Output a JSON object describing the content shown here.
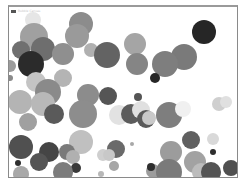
{
  "window": {
    "title": "Bubble Canvas",
    "title_icon": "app-icon"
  },
  "canvas": {
    "background": "#ffffff",
    "bubbles": [
      {
        "x": 32,
        "y": 18,
        "r": 8,
        "color": "#e6e6e6"
      },
      {
        "x": 80,
        "y": 22,
        "r": 12,
        "color": "#8c8c8c"
      },
      {
        "x": 76,
        "y": 34,
        "r": 12,
        "color": "#9a9a9a"
      },
      {
        "x": 33,
        "y": 35,
        "r": 14,
        "color": "#a0a0a0"
      },
      {
        "x": 20,
        "y": 48,
        "r": 9,
        "color": "#707070"
      },
      {
        "x": 42,
        "y": 47,
        "r": 12,
        "color": "#6e6e6e"
      },
      {
        "x": 62,
        "y": 52,
        "r": 11,
        "color": "#8f8f8f"
      },
      {
        "x": 90,
        "y": 48,
        "r": 7,
        "color": "#b0b0b0"
      },
      {
        "x": 106,
        "y": 53,
        "r": 13,
        "color": "#636363"
      },
      {
        "x": 134,
        "y": 42,
        "r": 11,
        "color": "#a5a5a5"
      },
      {
        "x": 136,
        "y": 62,
        "r": 11,
        "color": "#858585"
      },
      {
        "x": 203,
        "y": 30,
        "r": 12,
        "color": "#262626"
      },
      {
        "x": 183,
        "y": 55,
        "r": 13,
        "color": "#7a7a7a"
      },
      {
        "x": 164,
        "y": 62,
        "r": 13,
        "color": "#7e7e7e"
      },
      {
        "x": 154,
        "y": 76,
        "r": 5,
        "color": "#262626"
      },
      {
        "x": 30,
        "y": 62,
        "r": 13,
        "color": "#2b2b2b"
      },
      {
        "x": 9,
        "y": 64,
        "r": 6,
        "color": "#9c9c9c"
      },
      {
        "x": 9,
        "y": 76,
        "r": 3,
        "color": "#8a8a8a"
      },
      {
        "x": 62,
        "y": 76,
        "r": 9,
        "color": "#b4b4b4"
      },
      {
        "x": 35,
        "y": 80,
        "r": 10,
        "color": "#c4c4c4"
      },
      {
        "x": 47,
        "y": 90,
        "r": 13,
        "color": "#8a8a8a"
      },
      {
        "x": 87,
        "y": 93,
        "r": 11,
        "color": "#8c8c8c"
      },
      {
        "x": 107,
        "y": 94,
        "r": 9,
        "color": "#555555"
      },
      {
        "x": 137,
        "y": 95,
        "r": 4,
        "color": "#555555"
      },
      {
        "x": 19,
        "y": 100,
        "r": 12,
        "color": "#b4b4b4"
      },
      {
        "x": 42,
        "y": 102,
        "r": 12,
        "color": "#b8b8b8"
      },
      {
        "x": 53,
        "y": 112,
        "r": 10,
        "color": "#5a5a5a"
      },
      {
        "x": 82,
        "y": 112,
        "r": 14,
        "color": "#8d8d8d"
      },
      {
        "x": 27,
        "y": 120,
        "r": 9,
        "color": "#a0a0a0"
      },
      {
        "x": 118,
        "y": 113,
        "r": 10,
        "color": "#e2e2e2"
      },
      {
        "x": 130,
        "y": 112,
        "r": 10,
        "color": "#5c5c5c"
      },
      {
        "x": 140,
        "y": 108,
        "r": 9,
        "color": "#e0e0e0"
      },
      {
        "x": 145,
        "y": 117,
        "r": 9,
        "color": "#5a5a5a"
      },
      {
        "x": 148,
        "y": 116,
        "r": 7,
        "color": "#c9c9c9"
      },
      {
        "x": 168,
        "y": 113,
        "r": 13,
        "color": "#7e7e7e"
      },
      {
        "x": 182,
        "y": 107,
        "r": 8,
        "color": "#f0f0f0"
      },
      {
        "x": 218,
        "y": 102,
        "r": 7,
        "color": "#cfcfcf"
      },
      {
        "x": 225,
        "y": 100,
        "r": 6,
        "color": "#e0e0e0"
      },
      {
        "x": 80,
        "y": 140,
        "r": 12,
        "color": "#c0c0c0"
      },
      {
        "x": 20,
        "y": 145,
        "r": 12,
        "color": "#505050"
      },
      {
        "x": 48,
        "y": 150,
        "r": 10,
        "color": "#454545"
      },
      {
        "x": 66,
        "y": 150,
        "r": 8,
        "color": "#7a7a7a"
      },
      {
        "x": 72,
        "y": 155,
        "r": 7,
        "color": "#b0b0b0"
      },
      {
        "x": 38,
        "y": 160,
        "r": 9,
        "color": "#555555"
      },
      {
        "x": 75,
        "y": 166,
        "r": 5,
        "color": "#3a3a3a"
      },
      {
        "x": 115,
        "y": 147,
        "r": 9,
        "color": "#6a6a6a"
      },
      {
        "x": 102,
        "y": 153,
        "r": 6,
        "color": "#cfcfcf"
      },
      {
        "x": 108,
        "y": 153,
        "r": 6,
        "color": "#c8c8c8"
      },
      {
        "x": 113,
        "y": 164,
        "r": 5,
        "color": "#a6a6a6"
      },
      {
        "x": 131,
        "y": 142,
        "r": 2,
        "color": "#a8a8a8"
      },
      {
        "x": 170,
        "y": 150,
        "r": 11,
        "color": "#9c9c9c"
      },
      {
        "x": 190,
        "y": 138,
        "r": 9,
        "color": "#606060"
      },
      {
        "x": 194,
        "y": 160,
        "r": 11,
        "color": "#a2a2a2"
      },
      {
        "x": 212,
        "y": 137,
        "r": 6,
        "color": "#d9d9d9"
      },
      {
        "x": 212,
        "y": 150,
        "r": 3,
        "color": "#2e2e2e"
      },
      {
        "x": 20,
        "y": 172,
        "r": 8,
        "color": "#a8a8a8"
      },
      {
        "x": 17,
        "y": 161,
        "r": 3,
        "color": "#2e2e2e"
      },
      {
        "x": 62,
        "y": 170,
        "r": 10,
        "color": "#7c7c7c"
      },
      {
        "x": 152,
        "y": 169,
        "r": 7,
        "color": "#9c9c9c"
      },
      {
        "x": 150,
        "y": 165,
        "r": 4,
        "color": "#2e2e2e"
      },
      {
        "x": 168,
        "y": 170,
        "r": 13,
        "color": "#7a7a7a"
      },
      {
        "x": 200,
        "y": 170,
        "r": 9,
        "color": "#bcbcbc"
      },
      {
        "x": 210,
        "y": 170,
        "r": 10,
        "color": "#545454"
      },
      {
        "x": 230,
        "y": 166,
        "r": 8,
        "color": "#505050"
      },
      {
        "x": 100,
        "y": 172,
        "r": 3,
        "color": "#b8b8b8"
      },
      {
        "x": 48,
        "y": 178,
        "r": 2,
        "color": "#3a3a3a"
      },
      {
        "x": 80,
        "y": 178,
        "r": 2,
        "color": "#3a3a3a"
      },
      {
        "x": 139,
        "y": 178,
        "r": 2,
        "color": "#3a3a3a"
      }
    ]
  }
}
